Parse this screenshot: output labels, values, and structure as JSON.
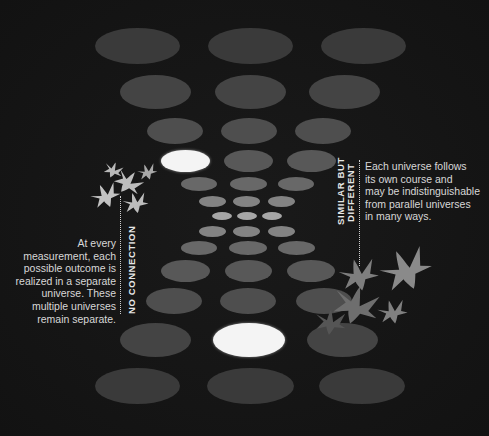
{
  "diagram": {
    "background_color": "#141414",
    "labels": {
      "left_heading": "NO CONNECTION",
      "left_caption_lines": [
        "At every",
        "measurement, each",
        "possible outcome is",
        "realized in a separate",
        "universe. These",
        "multiple universes",
        "remain separate."
      ],
      "right_heading_lines": [
        "SIMILAR BUT",
        "DIFFERENT"
      ],
      "right_caption_lines": [
        "Each universe follows",
        "its own course and",
        "may be indistinguishable",
        "from parallel universes",
        "in many ways."
      ]
    },
    "universes": [
      {
        "cx": 137,
        "cy": 46,
        "w": 85,
        "h": 36,
        "color": "#3a3a3a"
      },
      {
        "cx": 250,
        "cy": 46,
        "w": 85,
        "h": 36,
        "color": "#3a3a3a"
      },
      {
        "cx": 363,
        "cy": 46,
        "w": 85,
        "h": 36,
        "color": "#3a3a3a"
      },
      {
        "cx": 155,
        "cy": 92,
        "w": 71,
        "h": 34,
        "color": "#444444"
      },
      {
        "cx": 250,
        "cy": 92,
        "w": 71,
        "h": 34,
        "color": "#444444"
      },
      {
        "cx": 344,
        "cy": 92,
        "w": 71,
        "h": 34,
        "color": "#444444"
      },
      {
        "cx": 175,
        "cy": 131,
        "w": 56,
        "h": 26,
        "color": "#4e4e4e"
      },
      {
        "cx": 249,
        "cy": 131,
        "w": 56,
        "h": 26,
        "color": "#4e4e4e"
      },
      {
        "cx": 323,
        "cy": 131,
        "w": 56,
        "h": 26,
        "color": "#4e4e4e"
      },
      {
        "cx": 185,
        "cy": 161,
        "w": 49,
        "h": 22,
        "color": "#f4f4f4",
        "highlight": true
      },
      {
        "cx": 248,
        "cy": 161,
        "w": 49,
        "h": 22,
        "color": "#585858"
      },
      {
        "cx": 311,
        "cy": 161,
        "w": 49,
        "h": 22,
        "color": "#585858"
      },
      {
        "cx": 199,
        "cy": 184,
        "w": 36,
        "h": 14,
        "color": "#686868"
      },
      {
        "cx": 248,
        "cy": 184,
        "w": 37,
        "h": 14,
        "color": "#686868"
      },
      {
        "cx": 296,
        "cy": 184,
        "w": 36,
        "h": 14,
        "color": "#686868"
      },
      {
        "cx": 212,
        "cy": 201,
        "w": 27,
        "h": 11,
        "color": "#838383"
      },
      {
        "cx": 246,
        "cy": 201,
        "w": 27,
        "h": 11,
        "color": "#838383"
      },
      {
        "cx": 281,
        "cy": 201,
        "w": 27,
        "h": 11,
        "color": "#838383"
      },
      {
        "cx": 222,
        "cy": 216,
        "w": 20,
        "h": 8,
        "color": "#a6a6a6"
      },
      {
        "cx": 247,
        "cy": 216,
        "w": 20,
        "h": 8,
        "color": "#a6a6a6"
      },
      {
        "cx": 272,
        "cy": 216,
        "w": 20,
        "h": 8,
        "color": "#a6a6a6"
      },
      {
        "cx": 212,
        "cy": 231,
        "w": 27,
        "h": 11,
        "color": "#838383"
      },
      {
        "cx": 246,
        "cy": 231,
        "w": 27,
        "h": 11,
        "color": "#838383"
      },
      {
        "cx": 281,
        "cy": 231,
        "w": 27,
        "h": 11,
        "color": "#838383"
      },
      {
        "cx": 199,
        "cy": 248,
        "w": 36,
        "h": 14,
        "color": "#686868"
      },
      {
        "cx": 248,
        "cy": 248,
        "w": 38,
        "h": 14,
        "color": "#686868"
      },
      {
        "cx": 296,
        "cy": 248,
        "w": 37,
        "h": 14,
        "color": "#686868"
      },
      {
        "cx": 185,
        "cy": 271,
        "w": 49,
        "h": 22,
        "color": "#585858"
      },
      {
        "cx": 248,
        "cy": 271,
        "w": 47,
        "h": 22,
        "color": "#585858"
      },
      {
        "cx": 311,
        "cy": 271,
        "w": 48,
        "h": 22,
        "color": "#585858"
      },
      {
        "cx": 174,
        "cy": 301,
        "w": 56,
        "h": 26,
        "color": "#4e4e4e"
      },
      {
        "cx": 248,
        "cy": 301,
        "w": 56,
        "h": 26,
        "color": "#4e4e4e"
      },
      {
        "cx": 324,
        "cy": 301,
        "w": 56,
        "h": 26,
        "color": "#4e4e4e"
      },
      {
        "cx": 155,
        "cy": 340,
        "w": 71,
        "h": 34,
        "color": "#444444"
      },
      {
        "cx": 249,
        "cy": 340,
        "w": 72,
        "h": 34,
        "color": "#f4f4f4",
        "highlight": true
      },
      {
        "cx": 342,
        "cy": 340,
        "w": 71,
        "h": 34,
        "color": "#444444"
      },
      {
        "cx": 137,
        "cy": 386,
        "w": 85,
        "h": 36,
        "color": "#3a3a3a"
      },
      {
        "cx": 250,
        "cy": 386,
        "w": 87,
        "h": 36,
        "color": "#3a3a3a"
      },
      {
        "cx": 362,
        "cy": 386,
        "w": 86,
        "h": 36,
        "color": "#3a3a3a"
      }
    ],
    "birds_left": [
      {
        "x": 113,
        "y": 170,
        "s": 1.0,
        "rot": 20,
        "color": "#b8b8b8"
      },
      {
        "x": 128,
        "y": 182,
        "s": 1.5,
        "rot": 35,
        "color": "#bdbdbd"
      },
      {
        "x": 147,
        "y": 172,
        "s": 1.0,
        "rot": -20,
        "color": "#a9a9a9"
      },
      {
        "x": 105,
        "y": 196,
        "s": 1.5,
        "rot": -25,
        "color": "#c2c2c2"
      },
      {
        "x": 135,
        "y": 203,
        "s": 1.3,
        "rot": -15,
        "color": "#bdbdbd"
      }
    ],
    "birds_right": [
      {
        "x": 358,
        "y": 275,
        "s": 2.0,
        "rot": -15,
        "color": "#7e7e7e"
      },
      {
        "x": 405,
        "y": 270,
        "s": 2.6,
        "rot": -25,
        "color": "#8a8a8a"
      },
      {
        "x": 355,
        "y": 305,
        "s": 2.4,
        "rot": 15,
        "color": "#6e6e6e"
      },
      {
        "x": 392,
        "y": 312,
        "s": 1.5,
        "rot": -15,
        "color": "#808080"
      },
      {
        "x": 330,
        "y": 322,
        "s": 1.6,
        "rot": 5,
        "color": "#555555"
      }
    ]
  }
}
